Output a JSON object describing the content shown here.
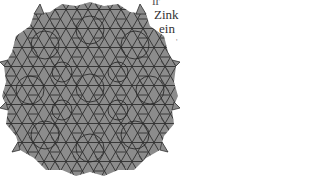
{
  "figure": {
    "tile_fill": "#8c8c8c",
    "tile_stroke": "#2f2f2f",
    "background": "#ffffff"
  },
  "text_column": {
    "lines": [
      "ir",
      "Zink",
      "ein",
      "'"
    ]
  }
}
